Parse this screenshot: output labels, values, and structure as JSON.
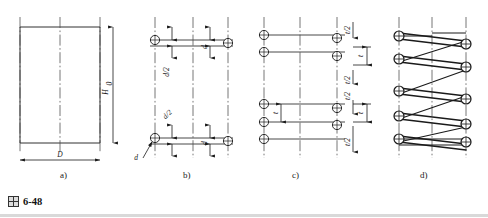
{
  "figure": {
    "caption_number": "6-48",
    "caption_prefix_icon": "cjk-tu-character",
    "type": "engineering-drawing",
    "panel_count": 4
  },
  "panels": [
    {
      "key": "a",
      "label": "a)",
      "label_x": 67,
      "label_y": 176,
      "description": "outline rectangle with overall diameter and free height",
      "dimensions": [
        {
          "name": "D",
          "text": "D",
          "orientation": "horizontal",
          "position": "bottom"
        },
        {
          "name": "H0",
          "text": "H",
          "subscript": "0",
          "orientation": "vertical",
          "position": "right"
        }
      ]
    },
    {
      "key": "b",
      "label": "b)",
      "label_x": 190,
      "label_y": 176,
      "description": "wire cross-section circles placed on the outline",
      "dimensions": [
        {
          "name": "d-upper-half",
          "text": "d/2",
          "orientation": "vertical"
        },
        {
          "name": "d-upper",
          "text": "d",
          "orientation": "vertical"
        },
        {
          "name": "d-lower-half",
          "text": "d/2",
          "orientation": "vertical"
        },
        {
          "name": "d-lower",
          "text": "d",
          "orientation": "vertical"
        },
        {
          "name": "wire-diameter-leader",
          "text": "d",
          "orientation": "leader"
        }
      ]
    },
    {
      "key": "c",
      "label": "c)",
      "label_x": 299,
      "label_y": 176,
      "description": "pitch spacing of remaining coil sections",
      "dimensions": [
        {
          "name": "t-half-top",
          "text": "t/2",
          "orientation": "vertical"
        },
        {
          "name": "t-right-upper",
          "text": "t",
          "orientation": "vertical"
        },
        {
          "name": "t-half-mid",
          "text": "t/2",
          "orientation": "vertical"
        },
        {
          "name": "t-half-lower",
          "text": "t/2",
          "orientation": "vertical"
        },
        {
          "name": "t-left",
          "text": "t",
          "orientation": "vertical"
        },
        {
          "name": "t-right-lower",
          "text": "t",
          "orientation": "vertical"
        },
        {
          "name": "t-half-bottom",
          "text": "t/2",
          "orientation": "vertical"
        }
      ]
    },
    {
      "key": "d",
      "label": "d)",
      "label_x": 427,
      "label_y": 176,
      "description": "finished spring with tangent coil lines",
      "dimensions": []
    }
  ],
  "style": {
    "line_color": "#1a1a1a",
    "centerline_color": "#4a4a4a",
    "background": "#ffffff",
    "footer_rule_color": "#d9d9d9"
  }
}
